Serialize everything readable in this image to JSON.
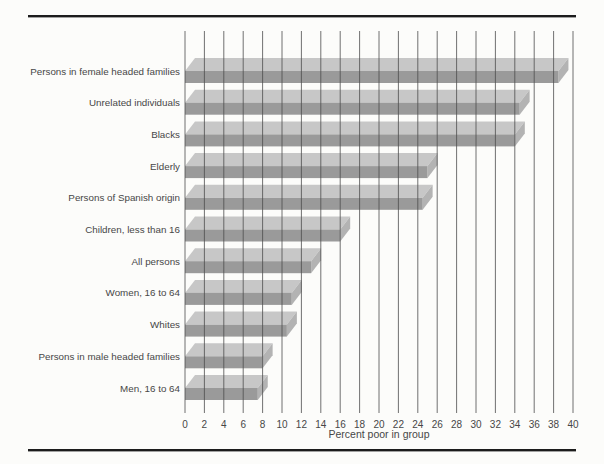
{
  "figure": {
    "xlabel": "Percent poor in group"
  },
  "chart_data": {
    "type": "bar",
    "orientation": "horizontal",
    "style": "3d-oblique-gray",
    "title": "",
    "xlabel": "Percent poor in group",
    "ylabel": "",
    "xlim": [
      0,
      40
    ],
    "xtick_step": 2,
    "xticks": [
      0,
      2,
      4,
      6,
      8,
      10,
      12,
      14,
      16,
      18,
      20,
      22,
      24,
      26,
      28,
      30,
      32,
      34,
      36,
      38,
      40
    ],
    "grid": "vertical-lines-over-bars",
    "legend": "none",
    "categories": [
      "Persons in female headed families",
      "Unrelated individuals",
      "Blacks",
      "Elderly",
      "Persons of Spanish origin",
      "Children, less than 16",
      "All persons",
      "Women, 16 to 64",
      "Whites",
      "Persons in male headed families",
      "Men, 16 to 64"
    ],
    "values": [
      38.5,
      34.5,
      34,
      25,
      24.5,
      16,
      13,
      11,
      10.5,
      8,
      7.5
    ],
    "colors": {
      "bar_front": "#9a9a9a",
      "bar_top": "#c7c7c7",
      "bar_end": "#b3b3b3",
      "background": "#fcfcfa",
      "gridline": "#4d4d4d",
      "text": "#474747",
      "rule": "#1c1c1c"
    }
  }
}
